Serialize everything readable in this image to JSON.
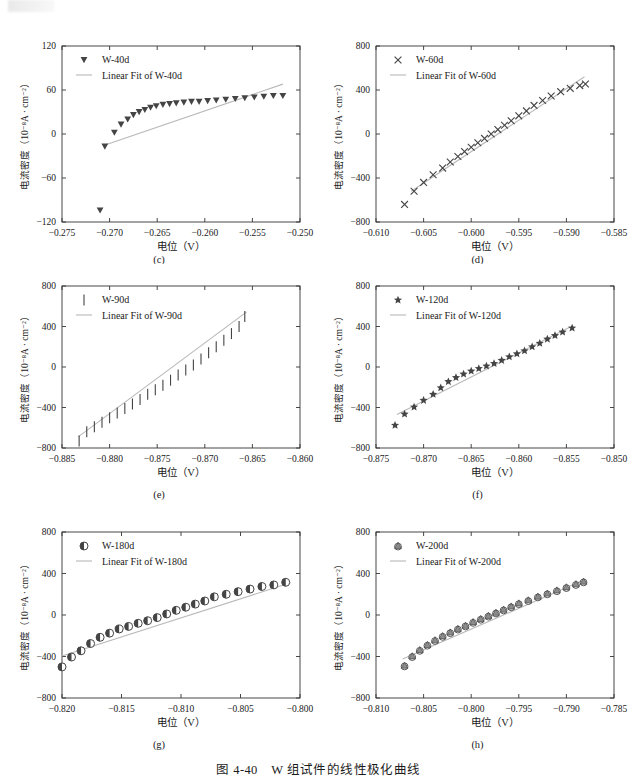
{
  "figure": {
    "caption": "图 4-40　W 组试件的线性极化曲线",
    "axis_label_x": "电位（V）",
    "axis_label_y": "电流密度（10⁻⁸A · cm⁻²）",
    "fit_color": "#b9b9b9",
    "marker_color": "#444444",
    "axis_color": "#333333"
  },
  "chart_data": [
    {
      "type": "scatter",
      "panel": "(c)",
      "title": "",
      "xlabel": "电位（V）",
      "ylabel": "电流密度（10⁻⁸A · cm⁻²）",
      "xlim": [
        -0.275,
        -0.25
      ],
      "ylim": [
        -120,
        120
      ],
      "xticks": [
        -0.275,
        -0.27,
        -0.265,
        -0.26,
        -0.255,
        -0.25
      ],
      "xticklabels": [
        "-0.275",
        "-0.270",
        "-0.265",
        "-0.260",
        "-0.255",
        "-0.250"
      ],
      "yticks": [
        -120,
        -60,
        0,
        60,
        120
      ],
      "yticklabels": [
        "-120",
        "-60",
        "0",
        "60",
        "120"
      ],
      "legend": [
        "W-40d",
        "Linear Fit of W-40d"
      ],
      "legend_position": "upper-left",
      "marker": "triangle-down",
      "grid": false,
      "series": [
        {
          "name": "W-40d",
          "x": [
            -0.271,
            -0.2705,
            -0.2695,
            -0.2688,
            -0.2681,
            -0.2675,
            -0.2669,
            -0.2663,
            -0.2657,
            -0.2651,
            -0.2644,
            -0.2637,
            -0.263,
            -0.2622,
            -0.2614,
            -0.2606,
            -0.2597,
            -0.2588,
            -0.2578,
            -0.2568,
            -0.2558,
            -0.2548,
            -0.2538,
            -0.2528,
            -0.2518
          ],
          "y": [
            -104,
            -17,
            2,
            13,
            20,
            26,
            30,
            33,
            36,
            38,
            40,
            41,
            42,
            43,
            44,
            44,
            45,
            46,
            47,
            48,
            49,
            50,
            51,
            52,
            52
          ]
        }
      ],
      "fit_line": {
        "name": "Linear Fit of W-40d",
        "x": [
          -0.2707,
          -0.2518
        ],
        "y": [
          -16,
          68
        ]
      }
    },
    {
      "type": "scatter",
      "panel": "(d)",
      "title": "",
      "xlabel": "电位（V）",
      "ylabel": "电流密度（10⁻⁸A · cm⁻²）",
      "xlim": [
        -0.61,
        -0.585
      ],
      "ylim": [
        -800,
        800
      ],
      "xticks": [
        -0.61,
        -0.605,
        -0.6,
        -0.595,
        -0.59,
        -0.585
      ],
      "xticklabels": [
        "-0.610",
        "-0.605",
        "-0.600",
        "-0.595",
        "-0.590",
        "-0.585"
      ],
      "yticks": [
        -800,
        -400,
        0,
        400,
        800
      ],
      "yticklabels": [
        "-800",
        "-400",
        "0",
        "400",
        "800"
      ],
      "legend": [
        "W-60d",
        "Linear Fit of W-60d"
      ],
      "legend_position": "upper-left",
      "marker": "cross",
      "grid": false,
      "series": [
        {
          "name": "W-60d",
          "x": [
            -0.607,
            -0.606,
            -0.605,
            -0.604,
            -0.603,
            -0.6022,
            -0.6014,
            -0.6007,
            -0.6,
            -0.5993,
            -0.5986,
            -0.5979,
            -0.5972,
            -0.5965,
            -0.5958,
            -0.595,
            -0.5942,
            -0.5934,
            -0.5925,
            -0.5916,
            -0.5906,
            -0.5896,
            -0.5886,
            -0.588
          ],
          "y": [
            -640,
            -520,
            -440,
            -370,
            -310,
            -255,
            -205,
            -160,
            -120,
            -80,
            -40,
            0,
            40,
            80,
            120,
            165,
            210,
            260,
            305,
            345,
            385,
            415,
            440,
            455
          ]
        }
      ],
      "fit_line": {
        "name": "Linear Fit of W-60d",
        "x": [
          -0.6063,
          -0.5881
        ],
        "y": [
          -520,
          520
        ]
      }
    },
    {
      "type": "scatter",
      "panel": "(e)",
      "title": "",
      "xlabel": "电位（V）",
      "ylabel": "电流密度（10⁻⁸A · cm⁻²）",
      "xlim": [
        -0.885,
        -0.86
      ],
      "ylim": [
        -800,
        800
      ],
      "xticks": [
        -0.885,
        -0.88,
        -0.875,
        -0.87,
        -0.865,
        -0.86
      ],
      "xticklabels": [
        "-0.885",
        "-0.880",
        "-0.875",
        "-0.870",
        "-0.865",
        "-0.860"
      ],
      "yticks": [
        -800,
        -400,
        0,
        400,
        800
      ],
      "yticklabels": [
        "-800",
        "-400",
        "0",
        "400",
        "800"
      ],
      "legend": [
        "W-90d",
        "Linear Fit of W-90d"
      ],
      "legend_position": "upper-left",
      "marker": "vline",
      "grid": false,
      "series": [
        {
          "name": "W-90d",
          "x": [
            -0.8832,
            -0.8824,
            -0.8816,
            -0.8808,
            -0.88,
            -0.8792,
            -0.8784,
            -0.8776,
            -0.8768,
            -0.876,
            -0.8752,
            -0.8744,
            -0.8736,
            -0.8728,
            -0.872,
            -0.8712,
            -0.8704,
            -0.8696,
            -0.8688,
            -0.868,
            -0.8672,
            -0.8664,
            -0.8658
          ],
          "y": [
            -730,
            -640,
            -590,
            -545,
            -500,
            -455,
            -410,
            -365,
            -320,
            -270,
            -225,
            -180,
            -130,
            -80,
            -30,
            20,
            80,
            140,
            200,
            265,
            330,
            400,
            500
          ]
        }
      ],
      "fit_line": {
        "name": "Linear Fit of W-90d",
        "x": [
          -0.8833,
          -0.8656
        ],
        "y": [
          -690,
          545
        ]
      }
    },
    {
      "type": "scatter",
      "panel": "(f)",
      "title": "",
      "xlabel": "电位（V）",
      "ylabel": "电流密度（10⁻⁸A · cm⁻²）",
      "xlim": [
        -0.875,
        -0.85
      ],
      "ylim": [
        -800,
        800
      ],
      "xticks": [
        -0.875,
        -0.87,
        -0.865,
        -0.86,
        -0.855,
        -0.85
      ],
      "xticklabels": [
        "-0.875",
        "-0.870",
        "-0.865",
        "-0.860",
        "-0.855",
        "-0.850"
      ],
      "yticks": [
        -800,
        -400,
        0,
        400,
        800
      ],
      "yticklabels": [
        "-800",
        "-400",
        "0",
        "400",
        "800"
      ],
      "legend": [
        "W-120d",
        "Linear Fit of W-120d"
      ],
      "legend_position": "upper-left",
      "marker": "star",
      "grid": false,
      "series": [
        {
          "name": "W-120d",
          "x": [
            -0.873,
            -0.872,
            -0.871,
            -0.87,
            -0.869,
            -0.8682,
            -0.8674,
            -0.8666,
            -0.8658,
            -0.865,
            -0.8642,
            -0.8634,
            -0.8626,
            -0.8618,
            -0.861,
            -0.8602,
            -0.8594,
            -0.8586,
            -0.8578,
            -0.857,
            -0.8562,
            -0.8554,
            -0.8544
          ],
          "y": [
            -575,
            -465,
            -395,
            -330,
            -270,
            -205,
            -145,
            -105,
            -70,
            -40,
            -15,
            10,
            35,
            65,
            100,
            130,
            160,
            200,
            235,
            275,
            310,
            345,
            385
          ]
        }
      ],
      "fit_line": {
        "name": "Linear Fit of W-120d",
        "x": [
          -0.8728,
          -0.8546
        ],
        "y": [
          -470,
          395
        ]
      }
    },
    {
      "type": "scatter",
      "panel": "(g)",
      "title": "",
      "xlabel": "电位（V）",
      "ylabel": "电流密度（10⁻⁸A · cm⁻²）",
      "xlim": [
        -0.82,
        -0.8
      ],
      "ylim": [
        -800,
        800
      ],
      "xticks": [
        -0.82,
        -0.815,
        -0.81,
        -0.805,
        -0.8
      ],
      "xticklabels": [
        "-0.820",
        "-0.815",
        "-0.810",
        "-0.805",
        "-0.800"
      ],
      "yticks": [
        -800,
        -400,
        0,
        400,
        800
      ],
      "yticklabels": [
        "-800",
        "-400",
        "0",
        "400",
        "800"
      ],
      "legend": [
        "W-180d",
        "Linear Fit of W-180d"
      ],
      "legend_position": "upper-left",
      "marker": "half-circle",
      "grid": false,
      "series": [
        {
          "name": "W-180d",
          "x": [
            -0.82,
            -0.8192,
            -0.8184,
            -0.8176,
            -0.8168,
            -0.816,
            -0.8152,
            -0.8144,
            -0.8136,
            -0.8128,
            -0.812,
            -0.8112,
            -0.8104,
            -0.8096,
            -0.8088,
            -0.808,
            -0.8072,
            -0.8062,
            -0.8052,
            -0.8042,
            -0.8032,
            -0.8022,
            -0.8012
          ],
          "y": [
            -500,
            -405,
            -345,
            -275,
            -215,
            -175,
            -135,
            -110,
            -80,
            -55,
            -25,
            10,
            45,
            75,
            105,
            135,
            175,
            200,
            225,
            250,
            275,
            290,
            315
          ]
        }
      ],
      "fit_line": {
        "name": "Linear Fit of W-180d",
        "x": [
          -0.82,
          -0.8008
        ],
        "y": [
          -395,
          310
        ]
      }
    },
    {
      "type": "scatter",
      "panel": "(h)",
      "title": "",
      "xlabel": "电位（V）",
      "ylabel": "电流密度（10⁻⁸A · cm⁻²）",
      "xlim": [
        -0.81,
        -0.785
      ],
      "ylim": [
        -800,
        800
      ],
      "xticks": [
        -0.81,
        -0.805,
        -0.8,
        -0.795,
        -0.79,
        -0.785
      ],
      "xticklabels": [
        "-0.810",
        "-0.805",
        "-0.800",
        "-0.795",
        "-0.790",
        "-0.785"
      ],
      "yticks": [
        -800,
        -400,
        0,
        400,
        800
      ],
      "yticklabels": [
        "-800",
        "-400",
        "0",
        "400",
        "800"
      ],
      "legend": [
        "W-200d",
        "Linear Fit of W-200d"
      ],
      "legend_position": "upper-left",
      "marker": "triangle-circle",
      "grid": false,
      "series": [
        {
          "name": "W-200d",
          "x": [
            -0.807,
            -0.8062,
            -0.8054,
            -0.8046,
            -0.8038,
            -0.803,
            -0.8022,
            -0.8014,
            -0.8006,
            -0.7998,
            -0.799,
            -0.7982,
            -0.7974,
            -0.7966,
            -0.7958,
            -0.795,
            -0.794,
            -0.793,
            -0.792,
            -0.791,
            -0.79,
            -0.789,
            -0.7882
          ],
          "y": [
            -490,
            -400,
            -340,
            -290,
            -245,
            -205,
            -170,
            -135,
            -105,
            -70,
            -40,
            -10,
            20,
            50,
            80,
            110,
            140,
            175,
            205,
            235,
            265,
            295,
            320
          ]
        }
      ],
      "fit_line": {
        "name": "Linear Fit of W-200d",
        "x": [
          -0.8072,
          -0.788
        ],
        "y": [
          -425,
          345
        ]
      }
    }
  ]
}
